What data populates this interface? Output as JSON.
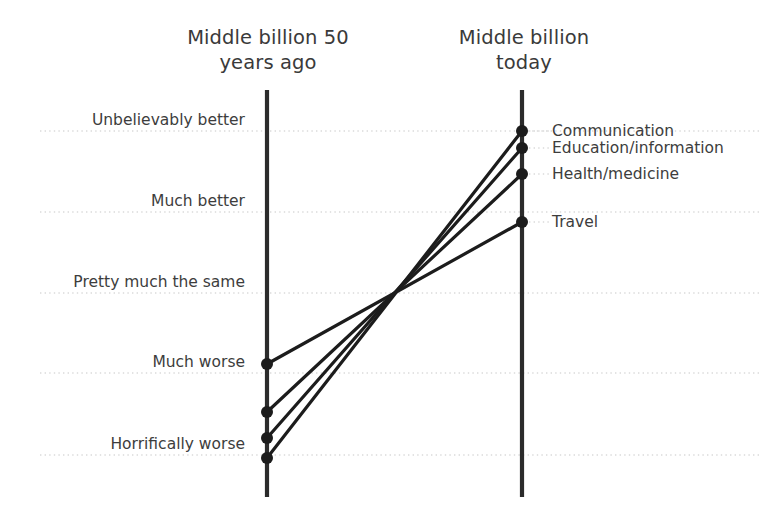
{
  "headers": {
    "left": "Middle billion 50\nyears ago",
    "right": "Middle billion\ntoday"
  },
  "colors": {
    "line": "#1c1c1c",
    "axis": "#2b2b2b",
    "gridline": "#c8c8c8",
    "text": "#3d3d3d",
    "background": "#ffffff"
  },
  "chart_data": {
    "type": "line",
    "title": "",
    "subtitle": "",
    "xlabel": "",
    "ylabel": "",
    "grid": true,
    "legend_position": "right-inline",
    "categories": [
      "Middle billion 50 years ago",
      "Middle billion today"
    ],
    "scale_labels": [
      "Unbelievably better",
      "Much better",
      "Pretty much the same",
      "Much worse",
      "Horrifically worse"
    ],
    "scale_values": [
      5,
      4,
      3,
      2,
      1
    ],
    "ylim": [
      0.6,
      5.4
    ],
    "series": [
      {
        "name": "Communication",
        "values": [
          0.95,
          5.0
        ],
        "labels": [
          "Horrifically worse",
          "Unbelievably better"
        ]
      },
      {
        "name": "Education/information",
        "values": [
          1.2,
          4.8
        ],
        "labels": [
          "Horrifically worse",
          "Unbelievably better"
        ]
      },
      {
        "name": "Health/medicine",
        "values": [
          1.55,
          4.5
        ],
        "labels": [
          "Horrifically worse",
          "Unbelievably better"
        ]
      },
      {
        "name": "Travel",
        "values": [
          2.1,
          3.9
        ],
        "labels": [
          "Much worse",
          "Much better"
        ]
      }
    ]
  },
  "geometry": {
    "left_axis_x": 267,
    "right_axis_x": 522,
    "axis_top_y": 90,
    "axis_bottom_y": 497,
    "grid_x_start": 40,
    "grid_x_end": 760,
    "gridline_y": [
      131,
      212,
      293,
      373,
      455
    ],
    "left_points_y": [
      458,
      438,
      412,
      364
    ],
    "right_points_y": [
      131,
      148,
      174,
      222
    ],
    "dot_radius": 6
  }
}
